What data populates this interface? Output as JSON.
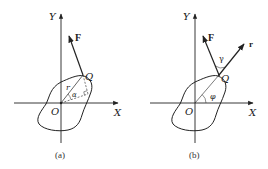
{
  "figure": {
    "panels": [
      {
        "id": "a",
        "caption": "(a)",
        "labels": {
          "y_axis": "Y",
          "x_axis": "X",
          "origin": "O",
          "point": "Q",
          "force": "F",
          "radius": "r",
          "angle": "α"
        }
      },
      {
        "id": "b",
        "caption": "(b)",
        "labels": {
          "y_axis": "Y",
          "x_axis": "X",
          "origin": "O",
          "point": "Q",
          "force": "F",
          "radius_vector": "r",
          "angle_between": "γ",
          "angle_polar": "φ"
        }
      }
    ],
    "colors": {
      "line": "#222222",
      "background": "#ffffff"
    }
  }
}
